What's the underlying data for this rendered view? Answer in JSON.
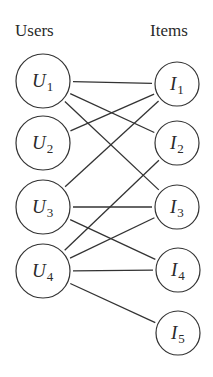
{
  "headers": {
    "users": "Users",
    "items": "Items"
  },
  "users": [
    {
      "id": "U1",
      "letter": "U",
      "index": "1"
    },
    {
      "id": "U2",
      "letter": "U",
      "index": "2"
    },
    {
      "id": "U3",
      "letter": "U",
      "index": "3"
    },
    {
      "id": "U4",
      "letter": "U",
      "index": "4"
    }
  ],
  "items": [
    {
      "id": "I1",
      "letter": "I",
      "index": "1"
    },
    {
      "id": "I2",
      "letter": "I",
      "index": "2"
    },
    {
      "id": "I3",
      "letter": "I",
      "index": "3"
    },
    {
      "id": "I4",
      "letter": "I",
      "index": "4"
    },
    {
      "id": "I5",
      "letter": "I",
      "index": "5"
    }
  ],
  "edges": [
    [
      "U1",
      "I1"
    ],
    [
      "U1",
      "I2"
    ],
    [
      "U1",
      "I3"
    ],
    [
      "U2",
      "I1"
    ],
    [
      "U3",
      "I1"
    ],
    [
      "U3",
      "I3"
    ],
    [
      "U3",
      "I4"
    ],
    [
      "U4",
      "I2"
    ],
    [
      "U4",
      "I3"
    ],
    [
      "U4",
      "I4"
    ],
    [
      "U4",
      "I5"
    ]
  ]
}
